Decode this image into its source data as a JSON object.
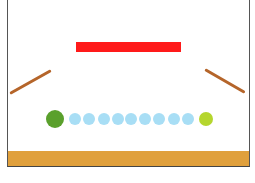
{
  "scene": {
    "background": "#ffffff",
    "border_color": "#555555"
  },
  "objects": {
    "ground": {
      "type": "static-bar",
      "color": "#E0A03C",
      "x": 8,
      "y": 151,
      "w": 241,
      "h": 15
    },
    "red_bar": {
      "type": "static-bar",
      "color": "#FF1A1A",
      "x": 76,
      "y": 42,
      "w": 105,
      "h": 10
    },
    "left_ramp": {
      "type": "static-ramp",
      "color": "#B5652A",
      "x1": 10,
      "y1": 93,
      "x2": 51,
      "y2": 70
    },
    "right_ramp": {
      "type": "static-ramp",
      "color": "#B5652A",
      "x1": 205,
      "y1": 69,
      "x2": 245,
      "y2": 92
    },
    "green_ball": {
      "type": "dynamic-ball",
      "color": "#5AA02C",
      "cx": 55,
      "cy": 119,
      "r": 9
    },
    "target_ball": {
      "type": "dynamic-ball",
      "color": "#B5D62E",
      "cx": 206,
      "cy": 119,
      "r": 7
    },
    "blue_balls": {
      "color": "#A8DEF5",
      "r": 6,
      "cy": 119,
      "centers_x": [
        75,
        89,
        104,
        118,
        131,
        145,
        159,
        174,
        188
      ]
    }
  }
}
